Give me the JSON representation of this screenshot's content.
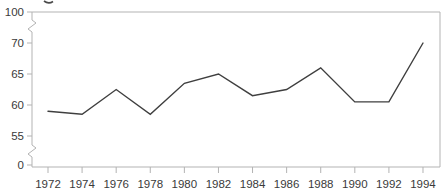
{
  "chart_data": {
    "type": "line",
    "title": "",
    "xlabel": "",
    "ylabel": "",
    "x": [
      1972,
      1974,
      1976,
      1978,
      1980,
      1982,
      1984,
      1986,
      1988,
      1990,
      1992,
      1994
    ],
    "x_tick_labels": [
      "1972",
      "1974",
      "1976",
      "1978",
      "1980",
      "1982",
      "1984",
      "1986",
      "1988",
      "1990",
      "1992",
      "1994"
    ],
    "values": [
      59,
      58.5,
      62.5,
      58.5,
      63.5,
      65,
      61.5,
      62.5,
      66,
      60.5,
      60.5,
      70
    ],
    "y_axis": {
      "tick_labels": [
        "100",
        "70",
        "65",
        "60",
        "55",
        "0"
      ],
      "linear_tick_values": [
        70,
        65,
        60,
        55
      ],
      "broken_axis": true,
      "breaks": [
        "between 70 and 100",
        "between 55 and 0"
      ],
      "visible_value_range_linear": [
        55,
        70
      ]
    },
    "grid": false,
    "legend": "none",
    "colors": {
      "series_line": "#3f3f3f",
      "axis_frame": "#b3b3b3",
      "tick_text": "#3a3a3a",
      "background": "#ffffff"
    }
  }
}
